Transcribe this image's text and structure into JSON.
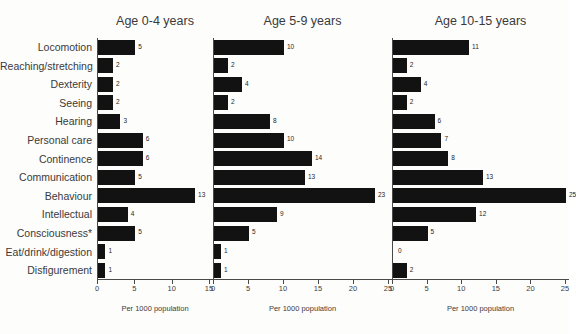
{
  "figure": {
    "cut_title": "",
    "background": "#fdfdfc",
    "bar_color": "#121212",
    "axis_color": "#4a4a4a"
  },
  "categories": [
    "Locomotion",
    "Reaching/stretching",
    "Dexterity",
    "Seeing",
    "Hearing",
    "Personal care",
    "Continence",
    "Communication",
    "Behaviour",
    "Intellectual",
    "Consciousness*",
    "Eat/drink/digestion",
    "Disfigurement"
  ],
  "panels": [
    {
      "title": "Age 0-4 years",
      "xlabel": "Per 1000 population",
      "xlim": [
        0,
        15
      ],
      "ticks": [
        0,
        5,
        10,
        15
      ],
      "values": [
        5,
        2,
        2,
        2,
        3,
        6,
        6,
        5,
        13,
        4,
        5,
        1,
        1
      ]
    },
    {
      "title": "Age 5-9 years",
      "xlabel": "Per 1000 population",
      "xlim": [
        0,
        25
      ],
      "ticks": [
        0,
        5,
        10,
        15,
        20,
        25
      ],
      "values": [
        10,
        2,
        4,
        2,
        8,
        10,
        14,
        13,
        23,
        9,
        5,
        1,
        1
      ]
    },
    {
      "title": "Age 10-15 years",
      "xlabel": "Per 1000 population",
      "xlim": [
        0,
        25
      ],
      "ticks": [
        0,
        5,
        10,
        15,
        20,
        25
      ],
      "values": [
        11,
        2,
        4,
        2,
        6,
        7,
        8,
        13,
        25,
        12,
        5,
        0,
        2
      ]
    }
  ],
  "chart_data": {
    "type": "bar",
    "title": "",
    "xlabel": "Per 1000 population",
    "ylabel": "",
    "orientation": "horizontal",
    "grid": false,
    "legend": "none",
    "panel_layout": "3 side-by-side panels sharing one shared y-axis category list",
    "categories": [
      "Locomotion",
      "Reaching/stretching",
      "Dexterity",
      "Seeing",
      "Hearing",
      "Personal care",
      "Continence",
      "Communication",
      "Behaviour",
      "Intellectual",
      "Consciousness*",
      "Eat/drink/digestion",
      "Disfigurement"
    ],
    "series": [
      {
        "name": "Age 0-4 years",
        "values": [
          5,
          2,
          2,
          2,
          3,
          6,
          6,
          5,
          13,
          4,
          5,
          1,
          1
        ],
        "xlim": [
          0,
          15
        ],
        "xticks": [
          0,
          5,
          10,
          15
        ]
      },
      {
        "name": "Age 5-9 years",
        "values": [
          10,
          2,
          4,
          2,
          8,
          10,
          14,
          13,
          23,
          9,
          5,
          1,
          1
        ],
        "xlim": [
          0,
          25
        ],
        "xticks": [
          0,
          5,
          10,
          15,
          20,
          25
        ]
      },
      {
        "name": "Age 10-15 years",
        "values": [
          11,
          2,
          4,
          2,
          6,
          7,
          8,
          13,
          25,
          12,
          5,
          0,
          2
        ],
        "xlim": [
          0,
          25
        ],
        "xticks": [
          0,
          5,
          10,
          15,
          20,
          25
        ]
      }
    ],
    "annotations": [
      "Each bar is labelled with its numeric value to the right of the bar end.",
      "* footnote marker on the Consciousness category"
    ]
  }
}
